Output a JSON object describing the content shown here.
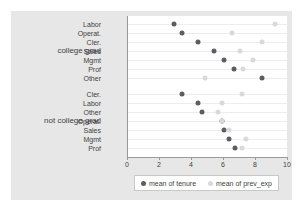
{
  "chart_data": {
    "type": "scatter",
    "title": "",
    "xlabel": "",
    "ylabel": "",
    "xlim": [
      0,
      10
    ],
    "xticks": [
      0,
      2,
      4,
      6,
      8,
      10
    ],
    "grid": true,
    "legend_position": "bottom",
    "legend": [
      {
        "name": "mean of tenure",
        "color": "#5d5d66"
      },
      {
        "name": "mean of prev_exp",
        "color": "#d9d9dd"
      }
    ],
    "groups": [
      {
        "label": "college grad",
        "categories": [
          "Labor",
          "Operat.",
          "Cler.",
          "Sales",
          "Mgmt",
          "Prof",
          "Other"
        ],
        "series": [
          {
            "name": "mean of tenure",
            "values": [
              2.9,
              3.4,
              4.4,
              5.4,
              6.0,
              6.6,
              8.4
            ]
          },
          {
            "name": "mean of prev_exp",
            "values": [
              9.2,
              6.5,
              8.4,
              7.0,
              7.8,
              7.2,
              4.8
            ]
          }
        ]
      },
      {
        "label": "not college grad",
        "categories": [
          "Cler.",
          "Labor",
          "Other",
          "Operat.",
          "Sales",
          "Mgmt",
          "Prof"
        ],
        "series": [
          {
            "name": "mean of tenure",
            "values": [
              3.4,
              4.4,
              4.6,
              5.9,
              6.0,
              6.3,
              6.7
            ]
          },
          {
            "name": "mean of prev_exp",
            "values": [
              7.1,
              5.9,
              5.6,
              5.9,
              6.3,
              7.4,
              7.1
            ]
          }
        ]
      }
    ]
  },
  "axis": {
    "tick_labels": [
      "0",
      "2",
      "4",
      "6",
      "8",
      "10"
    ]
  }
}
